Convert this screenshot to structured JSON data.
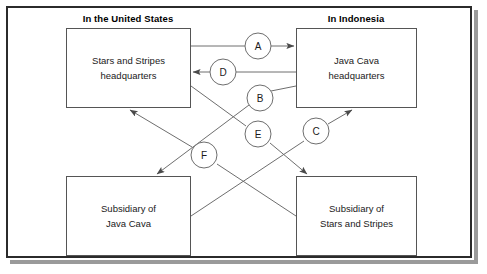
{
  "diagram": {
    "title_columns": {
      "left": "In the United States",
      "right": "In Indonesia"
    },
    "boxes": [
      {
        "id": "ss-hq",
        "line1": "Stars and Stripes",
        "line2": "headquarters"
      },
      {
        "id": "jc-hq",
        "line1": "Java Cava",
        "line2": "headquarters"
      },
      {
        "id": "jc-sub",
        "line1": "Subsidiary of",
        "line2": "Java Cava"
      },
      {
        "id": "ss-sub",
        "line1": "Subsidiary of",
        "line2": "Stars and Stripes"
      }
    ],
    "connectors": [
      {
        "id": "A",
        "label": "A"
      },
      {
        "id": "B",
        "label": "B"
      },
      {
        "id": "C",
        "label": "C"
      },
      {
        "id": "D",
        "label": "D"
      },
      {
        "id": "E",
        "label": "E"
      },
      {
        "id": "F",
        "label": "F"
      }
    ],
    "colors": {
      "frame_border": "#2b2b2b",
      "box_border": "#555555",
      "line": "#6e6e6e",
      "text": "#1a1a1a",
      "background": "#ffffff",
      "shadow": "#9a9a9a"
    }
  }
}
